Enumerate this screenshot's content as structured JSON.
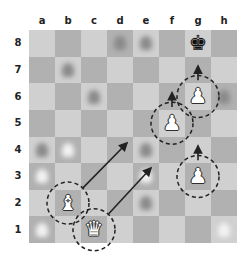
{
  "board": {
    "files": [
      "a",
      "b",
      "c",
      "d",
      "e",
      "f",
      "g",
      "h"
    ],
    "ranks": [
      "8",
      "7",
      "6",
      "5",
      "4",
      "3",
      "2",
      "1"
    ],
    "light_color": "#d0d0d0",
    "dark_color": "#b1b1b1"
  },
  "pieces": [
    {
      "square": "g8",
      "type": "king",
      "color": "black",
      "glyph": "♚"
    },
    {
      "square": "g6",
      "type": "pawn",
      "color": "white",
      "glyph": "♙"
    },
    {
      "square": "f5",
      "type": "pawn",
      "color": "white",
      "glyph": "♙"
    },
    {
      "square": "g3",
      "type": "pawn",
      "color": "white",
      "glyph": "♙"
    },
    {
      "square": "b2",
      "type": "bishop",
      "color": "white",
      "glyph": "♗"
    },
    {
      "square": "c1",
      "type": "queen",
      "color": "white",
      "glyph": "♕"
    }
  ],
  "blurred_pieces": [
    {
      "square": "d8",
      "tone": "dark"
    },
    {
      "square": "e8",
      "tone": "dark"
    },
    {
      "square": "b7",
      "tone": "dark"
    },
    {
      "square": "c6",
      "tone": "dark"
    },
    {
      "square": "a4",
      "tone": "dark"
    },
    {
      "square": "b4",
      "tone": "light"
    },
    {
      "square": "a3",
      "tone": "light"
    },
    {
      "square": "e4",
      "tone": "dark"
    },
    {
      "square": "e3",
      "tone": "light"
    },
    {
      "square": "e2",
      "tone": "dark"
    },
    {
      "square": "a1",
      "tone": "light"
    },
    {
      "square": "h1",
      "tone": "light"
    },
    {
      "square": "h6",
      "tone": "dark"
    }
  ],
  "highlights": [
    "g6",
    "f5",
    "g3",
    "b2",
    "c1"
  ],
  "arrows": [
    {
      "from": "g6",
      "to": "g7",
      "style": "short"
    },
    {
      "from": "f5",
      "to": "f6",
      "style": "short"
    },
    {
      "from": "g3",
      "to": "g4",
      "style": "short"
    },
    {
      "from": "b2",
      "to": [
        127,
        143
      ],
      "style": "diagonal"
    },
    {
      "from": "c1",
      "to": [
        151,
        168
      ],
      "style": "diagonal"
    }
  ]
}
